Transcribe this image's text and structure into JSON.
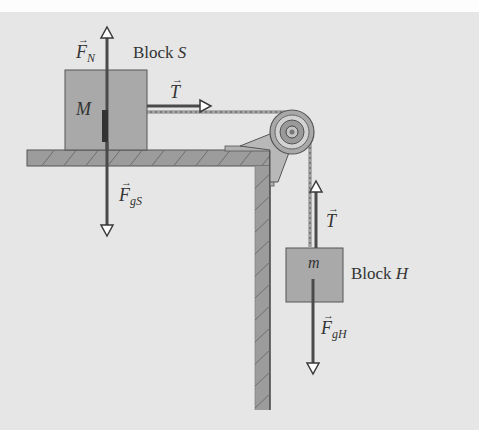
{
  "diagram": {
    "type": "free-body / pulley system",
    "colors": {
      "background": "#e6e6e6",
      "block_fill": "#a9a9a9",
      "wall_fill": "#9c9c9c",
      "arrow": "#4a4a4a",
      "text": "#333333"
    },
    "block_s": {
      "title_prefix": "Block ",
      "title_var": "S",
      "mass_label": "M"
    },
    "block_h": {
      "title_prefix": "Block ",
      "title_var": "H",
      "mass_label": "m"
    },
    "forces": {
      "normal": {
        "symbol": "F",
        "subscript": "N",
        "arrow": "→"
      },
      "gravity_s": {
        "symbol": "F",
        "subscript": "gS",
        "arrow": "→"
      },
      "tension_s": {
        "symbol": "T",
        "arrow": "→"
      },
      "tension_h": {
        "symbol": "T",
        "arrow": "→"
      },
      "gravity_h": {
        "symbol": "F",
        "subscript": "gH",
        "arrow": "→"
      }
    }
  }
}
